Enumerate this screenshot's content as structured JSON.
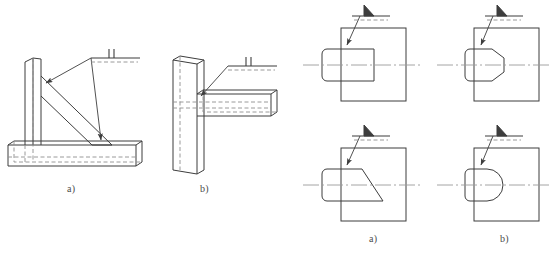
{
  "figure": {
    "type": "engineering-drawing",
    "background_color": "#ffffff",
    "line_color": "#3d3d3d",
    "hidden_line_color": "#8e8e8e",
    "center_line_color": "#9a9a9a",
    "label_color": "#4a4a4a"
  },
  "left_group": {
    "name": "bracket-assembly-views",
    "figures": [
      {
        "id": "left-a",
        "label": "a)",
        "description": "Bracket: vertical plate on base plate with diagonal gusset rib, fillet weld symbol with two tick marks",
        "weld_symbol": {
          "type": "reference-line-with-ticks",
          "tick_count": 2,
          "arrow_count": 2
        }
      },
      {
        "id": "left-b",
        "label": "b)",
        "description": "Tee joint: vertical plate with horizontal bar, fillet weld symbol with two tick marks",
        "weld_symbol": {
          "type": "reference-line-with-ticks",
          "tick_count": 2,
          "arrow_count": 1
        }
      }
    ]
  },
  "right_group": {
    "name": "shaft-plate-joint-views",
    "figures": [
      {
        "id": "right-top-left",
        "label": "",
        "description": "Square plate with flat-end cylindrical shaft, fillet weld flag symbol",
        "shaft_end": "flat",
        "weld_symbol": {
          "type": "filled-triangle-flag",
          "dashed_reference": true
        }
      },
      {
        "id": "right-top-right",
        "label": "",
        "description": "Square plate with conical chamfered-end shaft, fillet weld flag symbol",
        "shaft_end": "conical",
        "weld_symbol": {
          "type": "filled-triangle-flag",
          "dashed_reference": true
        }
      },
      {
        "id": "right-bottom-left",
        "label": "a)",
        "description": "Square plate with beveled angle-cut shaft end, fillet weld flag symbol",
        "shaft_end": "beveled",
        "weld_symbol": {
          "type": "filled-triangle-flag",
          "dashed_reference": true
        }
      },
      {
        "id": "right-bottom-right",
        "label": "b)",
        "description": "Square plate with rounded hemispherical shaft end, fillet weld flag symbol",
        "shaft_end": "rounded",
        "weld_symbol": {
          "type": "filled-triangle-flag",
          "dashed_reference": true
        }
      }
    ]
  },
  "labels": {
    "left_a": "a)",
    "left_b": "b)",
    "right_a": "a)",
    "right_b": "b)"
  }
}
